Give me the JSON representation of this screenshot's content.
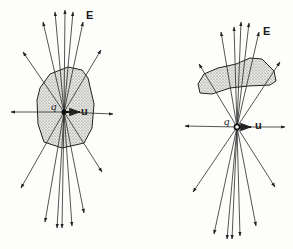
{
  "figure": {
    "line_color": "#2a2a2a",
    "blob_fill": "#d9d9d4",
    "background": "#fdfdfb"
  },
  "panels": [
    {
      "id": "left",
      "charge_label": "q",
      "velocity_label": "u",
      "field_label": "E",
      "charge": [
        64,
        112
      ]
    },
    {
      "id": "right",
      "charge_label": "q",
      "velocity_label": "u",
      "field_label": "E",
      "charge": [
        237,
        127
      ]
    }
  ]
}
